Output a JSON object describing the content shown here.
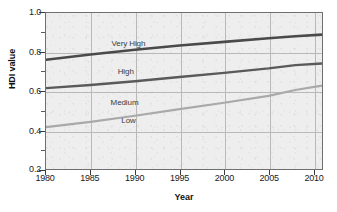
{
  "chart_data": {
    "type": "line",
    "title": "",
    "xlabel": "Year",
    "ylabel": "HDI value",
    "xlim": [
      1980,
      2011
    ],
    "ylim": [
      0.2,
      1.0
    ],
    "grid": true,
    "legend_position": "inline-labels",
    "x_ticks": [
      "1980",
      "1985",
      "1990",
      "1995",
      "2000",
      "2005",
      "2010"
    ],
    "x_tick_values": [
      1980,
      1985,
      1990,
      1995,
      2000,
      2005,
      2010
    ],
    "y_ticks": [
      "0.2",
      "0.4",
      "0.6",
      "0.8",
      "1.0"
    ],
    "y_tick_values": [
      0.2,
      0.4,
      0.6,
      0.8,
      1.0
    ],
    "y_minor_ticks": [
      0.3,
      0.5,
      0.7,
      0.9
    ],
    "x": [
      1980,
      1985,
      1990,
      1995,
      2000,
      2005,
      2008,
      2011
    ],
    "series": [
      {
        "name": "Very High",
        "color": "#4a4a4a",
        "values": [
          0.76,
          0.787,
          0.812,
          0.833,
          0.852,
          0.871,
          0.881,
          0.889
        ]
      },
      {
        "name": "High",
        "color": "#5a5a5a",
        "values": [
          0.615,
          0.631,
          0.65,
          0.672,
          0.693,
          0.716,
          0.733,
          0.741
        ]
      },
      {
        "name": "Medium",
        "color": "#a9a9a9",
        "values": [
          0.415,
          0.442,
          0.473,
          0.507,
          0.54,
          0.575,
          0.605,
          0.628
        ]
      },
      {
        "name": "Low",
        "color": "#bdbdbd",
        "values": [
          null,
          null,
          null,
          null,
          null,
          null,
          null,
          null
        ]
      }
    ],
    "series_labels": [
      {
        "text": "Very High",
        "x": 1987.3,
        "y": 0.845
      },
      {
        "text": "High",
        "x": 1988.0,
        "y": 0.7
      },
      {
        "text": "Medium",
        "x": 1987.2,
        "y": 0.545
      },
      {
        "text": "Low",
        "x": 1988.4,
        "y": 0.452
      }
    ],
    "colors": {
      "plot_background": "#eeeeee",
      "grid": "#b9b9b9",
      "axis": "#6f6f6f",
      "text": "#1a1a1a"
    }
  }
}
